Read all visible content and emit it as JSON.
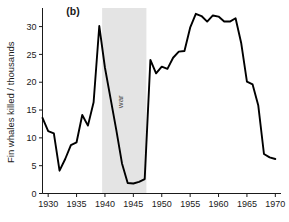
{
  "figure": {
    "panel_label": "(b)",
    "background_color": "#ffffff",
    "line_color": "#000000",
    "band_color": "#e4e4e4"
  },
  "chart_data": {
    "type": "line",
    "title": "",
    "subtitle": "",
    "panel": "(b)",
    "xlabel": "",
    "ylabel": "Fin whales killed / thousands",
    "xlim": [
      1929,
      1971
    ],
    "ylim": [
      0,
      32.8
    ],
    "xticks": [
      1930,
      1935,
      1940,
      1945,
      1950,
      1955,
      1960,
      1965,
      1970
    ],
    "xtick_labels": [
      "1930",
      "1935",
      "1940",
      "1945",
      "1950",
      "1955",
      "1960",
      "1965",
      "1970"
    ],
    "yticks": [
      0,
      5,
      10,
      15,
      20,
      25,
      30
    ],
    "ytick_labels": [
      "0",
      "5",
      "10",
      "15",
      "20",
      "25",
      "30"
    ],
    "grid": false,
    "legend": null,
    "annotations": [
      {
        "text": "war",
        "type": "shaded-band",
        "orientation": "vertical",
        "x_start": 1939.5,
        "x_end": 1947.3,
        "color": "#e4e4e4"
      },
      {
        "text": "(b)",
        "type": "panel-label",
        "x": 1933.2,
        "y": 32.0
      }
    ],
    "x": [
      1929,
      1930,
      1931,
      1932,
      1933,
      1934,
      1935,
      1936,
      1937,
      1938,
      1939,
      1940,
      1941,
      1942,
      1943,
      1944,
      1945,
      1946,
      1947,
      1948,
      1949,
      1950,
      1951,
      1952,
      1953,
      1954,
      1955,
      1956,
      1957,
      1958,
      1959,
      1960,
      1961,
      1962,
      1963,
      1964,
      1965,
      1966,
      1967,
      1968,
      1969,
      1970
    ],
    "values": [
      13.6,
      11.2,
      10.8,
      4.1,
      6.2,
      8.7,
      9.2,
      14.1,
      12.2,
      16.4,
      30.1,
      22.6,
      17.0,
      11.4,
      5.4,
      1.9,
      1.8,
      2.1,
      2.6,
      24.0,
      21.6,
      22.8,
      22.4,
      24.4,
      25.5,
      25.6,
      29.8,
      32.3,
      31.9,
      30.9,
      32.0,
      31.8,
      30.9,
      30.9,
      31.5,
      27.0,
      20.1,
      19.6,
      15.8,
      7.1,
      6.5,
      6.2
    ],
    "series": [
      {
        "name": "Fin whales killed",
        "color": "#000000",
        "values": [
          13.6,
          11.2,
          10.8,
          4.1,
          6.2,
          8.7,
          9.2,
          14.1,
          12.2,
          16.4,
          30.1,
          22.6,
          17.0,
          11.4,
          5.4,
          1.9,
          1.8,
          2.1,
          2.6,
          24.0,
          21.6,
          22.8,
          22.4,
          24.4,
          25.5,
          25.6,
          29.8,
          32.3,
          31.9,
          30.9,
          32.0,
          31.8,
          30.9,
          30.9,
          31.5,
          27.0,
          20.1,
          19.6,
          15.8,
          7.1,
          6.5,
          6.2
        ]
      }
    ]
  }
}
